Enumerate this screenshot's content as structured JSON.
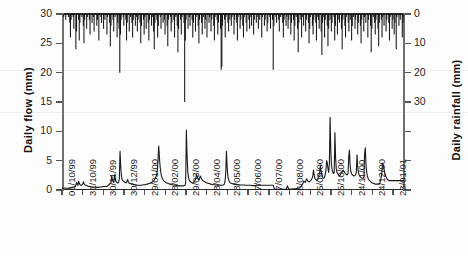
{
  "axes": {
    "left_title": "Daily flow (mm)",
    "right_title": "Daily rainfall (mm)",
    "left_ticks": [
      "0",
      "5",
      "10",
      "15",
      "20",
      "25",
      "30"
    ],
    "right_ticks": [
      "0",
      "10",
      "20",
      "30"
    ]
  },
  "chart_data": {
    "type": "line",
    "title": "",
    "xlabel": "",
    "ylabel": "Daily flow (mm)",
    "y2label": "Daily rainfall (mm)",
    "ylim": [
      0,
      30
    ],
    "y2lim": [
      60,
      0
    ],
    "y2_inverted": true,
    "grid": false,
    "legend": null,
    "x_tick_labels": [
      "01/10/99",
      "31/10/99",
      "30/11/99",
      "30/12/99",
      "29/01/00",
      "28/02/00",
      "29/03/00",
      "28/04/00",
      "28/05/00",
      "27/06/00",
      "27/07/00",
      "26/08/00",
      "25/09/00",
      "25/10/00",
      "24/11/00",
      "24/12/00",
      "23/01/01"
    ],
    "x_tick_days": [
      0,
      30,
      60,
      90,
      120,
      150,
      180,
      210,
      240,
      270,
      300,
      330,
      360,
      390,
      420,
      450,
      480
    ],
    "x_range_days": [
      0,
      496
    ],
    "series": [
      {
        "name": "Daily flow",
        "axis": "left",
        "unit": "mm",
        "style": "line",
        "values": [
          0.3,
          0.3,
          0.3,
          0.3,
          0.35,
          0.35,
          0.3,
          0.3,
          0.3,
          0.3,
          0.3,
          0.35,
          0.4,
          0.4,
          0.4,
          0.45,
          0.5,
          0.5,
          0.5,
          0.55,
          0.8,
          1.3,
          1.0,
          0.8,
          1.5,
          1.2,
          0.9,
          0.8,
          0.8,
          0.9,
          1.0,
          1.4,
          1.1,
          0.9,
          0.8,
          0.8,
          0.7,
          0.7,
          0.65,
          0.6,
          0.6,
          0.6,
          0.55,
          0.55,
          0.5,
          0.5,
          0.5,
          0.5,
          0.5,
          0.5,
          0.45,
          0.45,
          0.45,
          0.45,
          0.45,
          0.5,
          0.5,
          0.5,
          0.55,
          0.6,
          0.6,
          0.6,
          0.6,
          0.6,
          0.6,
          0.6,
          0.7,
          0.8,
          0.9,
          1.0,
          1.1,
          1.3,
          2.4,
          1.8,
          1.4,
          1.3,
          2.6,
          2.0,
          1.5,
          1.3,
          1.2,
          1.2,
          1.3,
          2.0,
          6.6,
          4.0,
          2.4,
          1.8,
          1.6,
          1.5,
          1.4,
          1.3,
          1.3,
          1.2,
          1.5,
          1.8,
          1.4,
          1.2,
          1.1,
          1.1,
          1.0,
          1.0,
          1.0,
          0.95,
          0.9,
          0.9,
          0.85,
          0.85,
          0.8,
          0.8,
          0.8,
          0.8,
          0.8,
          0.8,
          0.8,
          0.8,
          0.85,
          0.85,
          0.9,
          0.9,
          0.9,
          0.95,
          1.0,
          1.0,
          1.0,
          1.05,
          1.1,
          1.1,
          1.2,
          1.3,
          1.3,
          1.4,
          1.5,
          1.6,
          1.8,
          2.0,
          2.2,
          2.6,
          3.5,
          5.2,
          7.5,
          5.5,
          4.0,
          3.0,
          2.4,
          2.0,
          1.8,
          1.6,
          1.5,
          1.4,
          1.3,
          1.25,
          1.2,
          1.15,
          1.1,
          1.05,
          1.0,
          1.0,
          0.95,
          0.9,
          0.9,
          0.85,
          0.85,
          0.8,
          0.8,
          0.8,
          0.75,
          0.75,
          0.75,
          0.7,
          0.7,
          0.7,
          0.7,
          0.7,
          0.7,
          0.7,
          0.7,
          0.75,
          0.8,
          1.2,
          10.2,
          6.0,
          3.2,
          2.2,
          1.7,
          1.5,
          1.4,
          1.3,
          1.25,
          1.2,
          1.2,
          1.3,
          1.5,
          1.8,
          2.2,
          2.6,
          2.2,
          1.9,
          1.7,
          1.8,
          2.4,
          2.2,
          1.9,
          1.7,
          1.6,
          1.5,
          1.4,
          1.35,
          1.3,
          1.25,
          1.2,
          1.15,
          1.1,
          1.1,
          1.05,
          1.0,
          1.0,
          0.95,
          0.95,
          0.9,
          0.9,
          0.9,
          0.85,
          0.85,
          0.85,
          0.8,
          0.8,
          0.8,
          0.8,
          0.8,
          0.8,
          0.8,
          0.8,
          0.85,
          0.9,
          1.0,
          1.5,
          3.0,
          6.6,
          4.0,
          2.4,
          1.8,
          1.5,
          1.3,
          1.2,
          1.15,
          1.1,
          1.05,
          1.0,
          1.0,
          0.95,
          0.95,
          0.9,
          0.9,
          0.9,
          0.9,
          0.85,
          0.85,
          0.85,
          0.85,
          0.85,
          0.85,
          0.85,
          0.85,
          0.85,
          0.8,
          0.8,
          0.8,
          0.8,
          0.8,
          0.8,
          0.8,
          0.8,
          0.8,
          0.8,
          0.75,
          0.75,
          0.75,
          0.75,
          0.75,
          0.75,
          0.8,
          0.85,
          0.8,
          0.75,
          0.8,
          0.85,
          0.8,
          0.8,
          0.8,
          0.8,
          0.8,
          0.8,
          0.8,
          0.8,
          0.8,
          0.8,
          0.8,
          0.8,
          0.8,
          0.8,
          0.8,
          0.8,
          0.8,
          0.8,
          0.8,
          0.75,
          0.3,
          0.15,
          0.1,
          0.1,
          0.1,
          0.1,
          0.1,
          0.1,
          0.1,
          0.1,
          0.1,
          0.1,
          0.1,
          0.1,
          0.1,
          0.1,
          0.1,
          0.15,
          0.2,
          0.7,
          0.5,
          0.2,
          0.15,
          0.15,
          0.15,
          0.15,
          0.15,
          0.15,
          0.2,
          0.2,
          0.2,
          0.2,
          0.25,
          0.25,
          0.3,
          0.3,
          0.35,
          0.4,
          0.5,
          0.6,
          0.8,
          1.0,
          1.2,
          1.5,
          1.4,
          1.3,
          1.6,
          1.9,
          1.7,
          1.5,
          1.4,
          1.4,
          1.5,
          1.6,
          1.8,
          2.0,
          2.4,
          3.4,
          2.6,
          2.0,
          1.8,
          1.7,
          1.6,
          1.8,
          2.2,
          2.6,
          3.0,
          4.2,
          3.2,
          2.6,
          2.2,
          2.0,
          2.0,
          2.2,
          2.6,
          3.4,
          5.0,
          4.6,
          3.6,
          3.0,
          4.4,
          12.4,
          7.0,
          4.4,
          3.4,
          3.0,
          2.8,
          3.0,
          9.8,
          5.4,
          3.6,
          3.0,
          2.8,
          2.6,
          2.5,
          2.4,
          2.6,
          2.8,
          3.0,
          3.2,
          3.4,
          3.2,
          3.0,
          2.8,
          2.7,
          2.6,
          2.6,
          2.8,
          5.6,
          6.8,
          4.2,
          3.2,
          2.8,
          2.6,
          2.5,
          2.4,
          2.4,
          2.5,
          2.6,
          3.0,
          6.0,
          4.0,
          3.0,
          2.6,
          2.4,
          2.2,
          2.1,
          2.0,
          2.0,
          2.0,
          2.2,
          6.2,
          7.2,
          4.4,
          3.0,
          2.4,
          2.0,
          1.8,
          1.6,
          1.5,
          1.4,
          1.3,
          1.2,
          1.2,
          1.1,
          1.1,
          1.0,
          1.0,
          1.0,
          1.0,
          1.0,
          1.0,
          1.0,
          1.2,
          1.6,
          2.2,
          3.0,
          4.6,
          4.2,
          3.6,
          3.0,
          2.6,
          2.2,
          2.0,
          1.8,
          1.7,
          1.6,
          1.6,
          1.6,
          1.6,
          1.6,
          1.6,
          1.6,
          1.6,
          1.6,
          1.6,
          1.6,
          1.6,
          1.6,
          1.6,
          1.6,
          1.6,
          1.6,
          1.6,
          1.6,
          1.6,
          1.6,
          1.6,
          1.6
        ]
      },
      {
        "name": "Daily rainfall",
        "axis": "right",
        "unit": "mm",
        "style": "bar-inverted-from-top",
        "values": [
          0,
          0,
          1,
          0,
          0,
          2,
          0,
          0,
          0,
          1,
          0,
          3,
          8,
          2,
          0,
          0,
          1,
          5,
          0,
          0,
          12,
          6,
          0,
          0,
          2,
          9,
          3,
          0,
          0,
          1,
          0,
          4,
          10,
          2,
          0,
          0,
          5,
          1,
          0,
          0,
          2,
          7,
          0,
          0,
          3,
          0,
          1,
          6,
          0,
          0,
          0,
          4,
          2,
          0,
          9,
          0,
          0,
          1,
          3,
          0,
          0,
          5,
          0,
          2,
          0,
          0,
          7,
          1,
          0,
          0,
          3,
          11,
          4,
          0,
          0,
          2,
          6,
          0,
          1,
          0,
          0,
          8,
          3,
          0,
          5,
          20,
          7,
          2,
          0,
          0,
          1,
          4,
          0,
          0,
          2,
          9,
          3,
          0,
          0,
          6,
          0,
          1,
          0,
          3,
          8,
          2,
          0,
          0,
          4,
          0,
          1,
          6,
          2,
          0,
          0,
          3,
          10,
          4,
          0,
          0,
          2,
          7,
          1,
          0,
          5,
          0,
          0,
          3,
          9,
          2,
          0,
          0,
          4,
          1,
          0,
          6,
          12,
          3,
          0,
          0,
          2,
          8,
          4,
          0,
          0,
          1,
          5,
          0,
          0,
          3,
          0,
          2,
          7,
          0,
          0,
          4,
          11,
          2,
          0,
          0,
          1,
          6,
          3,
          0,
          0,
          2,
          8,
          0,
          1,
          0,
          4,
          13,
          5,
          0,
          0,
          2,
          7,
          1,
          0,
          0,
          3,
          30,
          9,
          2,
          0,
          0,
          5,
          0,
          1,
          4,
          0,
          0,
          2,
          8,
          3,
          0,
          0,
          6,
          1,
          0,
          0,
          4,
          10,
          2,
          0,
          0,
          3,
          7,
          0,
          1,
          0,
          5,
          2,
          0,
          8,
          0,
          0,
          3,
          1,
          0,
          6,
          2,
          0,
          0,
          4,
          9,
          1,
          0,
          0,
          2,
          7,
          3,
          0,
          0,
          5,
          19,
          18,
          4,
          0,
          0,
          2,
          8,
          1,
          0,
          0,
          3,
          6,
          0,
          2,
          0,
          4,
          1,
          0,
          0,
          7,
          2,
          0,
          0,
          3,
          9,
          1,
          0,
          0,
          5,
          2,
          0,
          0,
          4,
          8,
          1,
          0,
          0,
          3,
          6,
          0,
          0,
          2,
          5,
          0,
          1,
          4,
          0,
          0,
          7,
          2,
          0,
          0,
          3,
          1,
          0,
          5,
          0,
          2,
          0,
          0,
          8,
          1,
          0,
          0,
          4,
          2,
          0,
          0,
          6,
          3,
          0,
          0,
          1,
          5,
          0,
          0,
          2,
          19,
          4,
          0,
          0,
          1,
          3,
          0,
          0,
          2,
          6,
          0,
          1,
          0,
          0,
          3,
          8,
          2,
          0,
          0,
          4,
          1,
          0,
          5,
          2,
          0,
          0,
          7,
          3,
          0,
          0,
          2,
          9,
          4,
          0,
          1,
          0,
          5,
          13,
          3,
          0,
          0,
          2,
          8,
          1,
          0,
          4,
          0,
          0,
          6,
          2,
          0,
          0,
          3,
          10,
          5,
          1,
          0,
          0,
          4,
          7,
          2,
          0,
          0,
          3,
          9,
          1,
          0,
          2,
          5,
          0,
          0,
          6,
          14,
          3,
          0,
          1,
          8,
          2,
          0,
          0,
          4,
          11,
          5,
          0,
          2,
          0,
          6,
          3,
          0,
          0,
          1,
          9,
          4,
          0,
          0,
          7,
          2,
          0,
          3,
          0,
          0,
          5,
          12,
          2,
          0,
          0,
          4,
          8,
          1,
          0,
          0,
          3,
          6,
          0,
          2,
          0,
          9,
          4,
          0,
          1,
          0,
          5,
          2,
          0,
          0,
          7,
          3,
          0,
          0,
          4,
          10,
          2,
          0,
          0,
          6,
          1,
          0,
          3,
          0,
          0,
          8,
          2,
          0,
          0,
          4,
          13,
          5,
          0,
          1,
          0,
          3,
          7,
          2,
          0,
          0,
          5,
          11,
          3,
          0,
          0,
          2,
          8,
          1,
          0,
          4,
          0,
          0,
          6,
          2,
          0,
          0,
          3,
          9,
          1,
          0,
          0,
          5,
          2,
          0,
          7,
          3,
          0,
          12,
          1,
          0,
          0,
          4,
          0,
          2,
          0,
          0,
          8,
          3,
          1
        ]
      }
    ]
  }
}
